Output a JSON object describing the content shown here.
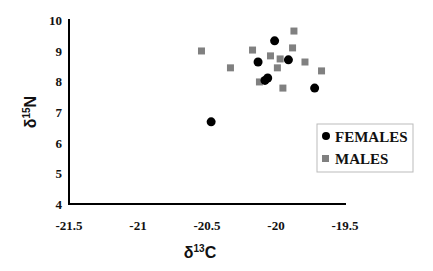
{
  "chart_data": {
    "type": "scatter",
    "title": "",
    "xlabel": "δ13C",
    "ylabel": "δ15N",
    "xlim": [
      -21.5,
      -19.5
    ],
    "ylim": [
      4,
      10
    ],
    "xticks": [
      -21.5,
      -21,
      -20.5,
      -20,
      -19.5
    ],
    "xtick_labels": [
      "-21.5",
      "-21",
      "-20.5",
      "-20",
      "-19.5"
    ],
    "yticks": [
      4,
      5,
      6,
      7,
      8,
      9,
      10
    ],
    "ytick_labels": [
      "4",
      "5",
      "6",
      "7",
      "8",
      "9",
      "10"
    ],
    "grid": false,
    "legend_position": "right-middle",
    "series": [
      {
        "name": "FEMALES",
        "marker": "circle",
        "color": "#000000",
        "points": [
          {
            "x": -20.01,
            "y": 9.32
          },
          {
            "x": -20.13,
            "y": 8.63
          },
          {
            "x": -19.91,
            "y": 8.7
          },
          {
            "x": -20.06,
            "y": 8.11
          },
          {
            "x": -20.08,
            "y": 8.03
          },
          {
            "x": -19.72,
            "y": 7.78
          },
          {
            "x": -20.47,
            "y": 6.68
          }
        ]
      },
      {
        "name": "MALES",
        "marker": "square",
        "color": "#808080",
        "points": [
          {
            "x": -20.54,
            "y": 8.99
          },
          {
            "x": -20.33,
            "y": 8.44
          },
          {
            "x": -20.17,
            "y": 9.02
          },
          {
            "x": -19.87,
            "y": 9.64
          },
          {
            "x": -19.88,
            "y": 9.09
          },
          {
            "x": -20.04,
            "y": 8.83
          },
          {
            "x": -19.97,
            "y": 8.73
          },
          {
            "x": -19.79,
            "y": 8.63
          },
          {
            "x": -19.99,
            "y": 8.44
          },
          {
            "x": -19.67,
            "y": 8.34
          },
          {
            "x": -20.12,
            "y": 7.98
          },
          {
            "x": -19.95,
            "y": 7.78
          }
        ]
      }
    ]
  },
  "legend": {
    "items": [
      {
        "label": "FEMALES",
        "marker": "circle",
        "color": "#000000"
      },
      {
        "label": "MALES",
        "marker": "square",
        "color": "#808080"
      }
    ]
  },
  "axes": {
    "x_title_main": "δ",
    "x_title_sup": "13",
    "x_title_end": "C",
    "y_title_main": "δ",
    "y_title_sup": "15",
    "y_title_end": "N"
  }
}
